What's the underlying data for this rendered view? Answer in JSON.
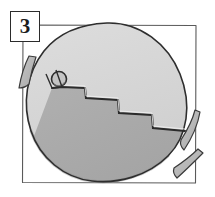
{
  "panel": {
    "step_number": "3",
    "caption": "",
    "border_color": "#555555",
    "frame": {
      "x": 22,
      "y": 25,
      "width": 174,
      "height": 158
    }
  },
  "illustration": {
    "subject": "cracked-egg",
    "outline_color": "#2e2e2e",
    "egg_upper_fill": "#d6d6d6",
    "egg_lower_fill": "#aeaeae",
    "shell_fragment_fill": "#b8b8b8",
    "hole_fill": "#c9c9c9",
    "background_fill": "#ffffff",
    "egg": {
      "center_x": 108,
      "center_y": 103,
      "radius_x": 78,
      "radius_y": 80,
      "rotation_deg": -18
    },
    "crack": {
      "style": "zigzag-staircase",
      "points": "52,88 62,87 85,88 86,98 118,100 119,113 152,115 153,128 185,131"
    },
    "hole": {
      "center_x": 59,
      "center_y": 79,
      "radius": 7.5
    },
    "fragments": [
      {
        "name": "fragment-left",
        "x": 24,
        "y": 72
      },
      {
        "name": "fragment-right-upper",
        "x": 190,
        "y": 133
      },
      {
        "name": "fragment-right-lower",
        "x": 195,
        "y": 170
      }
    ]
  }
}
